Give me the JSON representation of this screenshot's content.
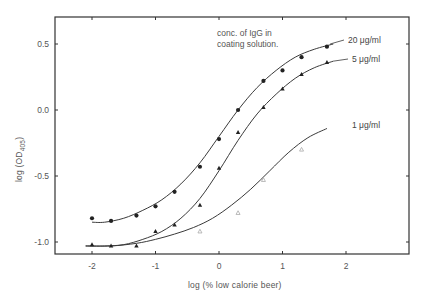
{
  "chart_data": {
    "type": "line",
    "title": "",
    "xlabel": "log (% low calorie beer)",
    "ylabel": "log (OD405)",
    "ylabel_main": "log (OD",
    "ylabel_sub": "405",
    "ylabel_close": ")",
    "xlim": [
      -2.6,
      3.0
    ],
    "ylim": [
      -1.1,
      0.7
    ],
    "x_ticks": [
      -2,
      -1,
      0,
      1,
      2
    ],
    "x_tick_labels": [
      "-2",
      "-1",
      "0",
      "1",
      "2"
    ],
    "y_ticks": [
      0.5,
      0.0,
      -0.5,
      -1.0
    ],
    "y_tick_labels": [
      "0.5",
      "0.0",
      "-0.5",
      "-1.0"
    ],
    "grid": false,
    "legend_position": "inline-right",
    "annotation": [
      "conc. of IgG in",
      "coating solution."
    ],
    "series": [
      {
        "name": "20 µg/ml",
        "label": "20 μg/ml",
        "marker": "filled-circle",
        "x": [
          -2,
          -1.7,
          -1.3,
          -1,
          -0.7,
          -0.3,
          0,
          0.3,
          0.7,
          1,
          1.3,
          1.7
        ],
        "values": [
          -0.82,
          -0.84,
          -0.8,
          -0.73,
          -0.62,
          -0.43,
          -0.22,
          0.0,
          0.22,
          0.3,
          0.4,
          0.48
        ],
        "curve_x": [
          -2.0,
          -1.8,
          -1.5,
          -1.2,
          -0.9,
          -0.6,
          -0.3,
          0.0,
          0.3,
          0.6,
          0.9,
          1.2,
          1.5,
          1.8
        ],
        "curve_y": [
          -0.85,
          -0.85,
          -0.82,
          -0.76,
          -0.68,
          -0.56,
          -0.4,
          -0.2,
          0.0,
          0.17,
          0.3,
          0.4,
          0.46,
          0.5
        ]
      },
      {
        "name": "5 µg/ml",
        "label": "5 μg/ml",
        "marker": "filled-triangle",
        "x": [
          -2,
          -1.7,
          -1.3,
          -1,
          -0.7,
          -0.3,
          0,
          0.3,
          0.7,
          1,
          1.3,
          1.7
        ],
        "values": [
          -1.02,
          -1.03,
          -1.03,
          -0.92,
          -0.87,
          -0.72,
          -0.44,
          -0.17,
          0.02,
          0.16,
          0.27,
          0.36
        ],
        "curve_x": [
          -2.1,
          -1.8,
          -1.5,
          -1.2,
          -0.9,
          -0.6,
          -0.3,
          0.0,
          0.3,
          0.6,
          0.9,
          1.2,
          1.5,
          1.8
        ],
        "curve_y": [
          -1.03,
          -1.03,
          -1.02,
          -0.98,
          -0.92,
          -0.82,
          -0.67,
          -0.46,
          -0.23,
          -0.03,
          0.12,
          0.24,
          0.32,
          0.37
        ]
      },
      {
        "name": "1 µg/ml",
        "label": "1 μg/ml",
        "marker": "open-triangle",
        "x": [
          -0.3,
          0.3,
          0.7,
          1.3
        ],
        "values": [
          -0.92,
          -0.78,
          -0.53,
          -0.3
        ],
        "curve_x": [
          -2.1,
          -1.7,
          -1.3,
          -1.0,
          -0.7,
          -0.4,
          -0.1,
          0.2,
          0.5,
          0.8,
          1.1,
          1.4,
          1.7
        ],
        "curve_y": [
          -1.03,
          -1.03,
          -1.01,
          -0.98,
          -0.94,
          -0.89,
          -0.82,
          -0.72,
          -0.6,
          -0.46,
          -0.32,
          -0.21,
          -0.14
        ]
      }
    ]
  },
  "layout": {
    "plot_left": 55,
    "plot_right": 409,
    "plot_top": 17,
    "plot_bottom": 254,
    "x0_px": 219,
    "px_per_x": 63.5,
    "y0_px": 110,
    "px_per_y": 132,
    "colors": {
      "axis": "#333333",
      "line": "#3a3a3a",
      "marker": "#222222",
      "open_marker": "#aaaaaa",
      "text": "#555555"
    }
  }
}
